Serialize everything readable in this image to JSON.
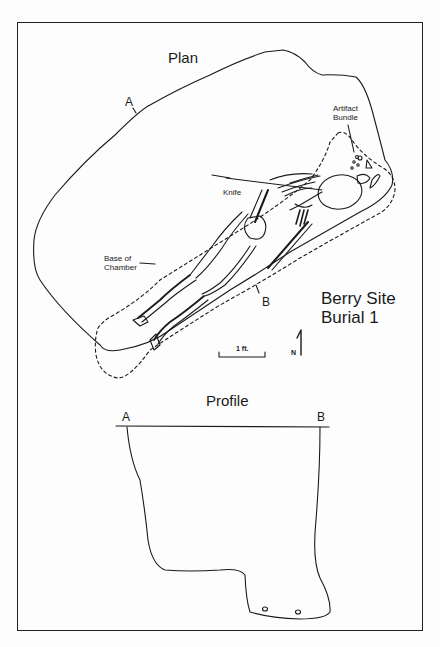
{
  "figure": {
    "site_title_line1": "Berry Site",
    "site_title_line2": "Burial 1"
  },
  "plan": {
    "title": "Plan",
    "section_point_a": "A",
    "section_point_b": "B",
    "labels": {
      "artifact_bundle_line1": "Artifact",
      "artifact_bundle_line2": "Bundle",
      "knife": "Knife",
      "base_of_chamber_line1": "Base of",
      "base_of_chamber_line2": "Chamber"
    },
    "scale_bar": {
      "label": "1 ft."
    },
    "north_arrow": {
      "label": "N"
    }
  },
  "profile": {
    "title": "Profile",
    "left_end": "A",
    "right_end": "B"
  },
  "colors": {
    "line": "#1a1a1a",
    "background": "#fdfdfd"
  }
}
